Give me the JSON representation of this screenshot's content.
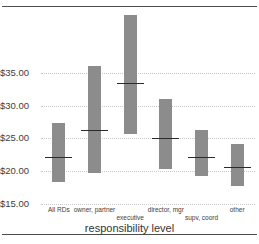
{
  "chart_data": {
    "type": "bar",
    "title": "",
    "subtitle": "",
    "xlabel": "responsibility level",
    "ylabel": "",
    "ylim": [
      15,
      45
    ],
    "grid": true,
    "legend": "none",
    "note": "Floating/range bars (high-low) with a horizontal median marker inside each bar. Values in US dollars.",
    "categories": [
      "All RDs",
      "owner, partner",
      "executive",
      "director, mgr",
      "supv, coord",
      "other"
    ],
    "ytick_labels": [
      "$35.00",
      "$30.00",
      "$25.00",
      "$20.00",
      "$15.00"
    ],
    "ytick_values": [
      35,
      30,
      25,
      20,
      15
    ],
    "series": [
      {
        "name": "range low",
        "values": [
          18.4,
          19.7,
          25.6,
          20.4,
          19.3,
          17.7
        ]
      },
      {
        "name": "range high",
        "values": [
          27.4,
          36.0,
          43.8,
          31.0,
          26.2,
          24.2
        ]
      },
      {
        "name": "median",
        "values": [
          22.2,
          26.3,
          33.5,
          25.0,
          22.1,
          20.6
        ]
      }
    ],
    "colors": {
      "bar": "#8c8c8c",
      "median": "#2b2b2b",
      "grid": "#c9c9c9",
      "frame": "#4d4d4d",
      "text": "#3d3d3d",
      "background": "#ffffff"
    }
  }
}
